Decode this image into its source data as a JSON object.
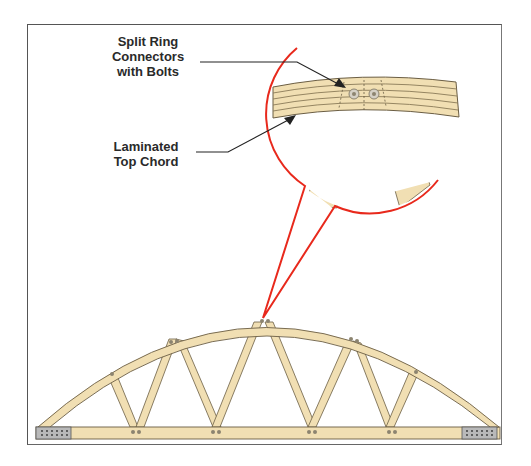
{
  "diagram": {
    "labels": {
      "connectors": {
        "line1": "Split Ring",
        "line2": "Connectors",
        "line3": "with Bolts"
      },
      "top_chord": {
        "line1": "Laminated",
        "line2": "Top Chord"
      }
    },
    "colors": {
      "wood": "#f1dfb3",
      "wood_edge": "#6b5e44",
      "lamination": "#8a7a58",
      "callout": "#e8291c",
      "leader": "#222222",
      "bolt": "#8c8470",
      "plate": "#b9b9b9",
      "frame": "#555555"
    },
    "components": [
      "bowstring-truss",
      "top-chord-arc",
      "bottom-chord",
      "web-members",
      "heel-plates",
      "bolt-connectors",
      "magnified-detail-callout"
    ]
  }
}
